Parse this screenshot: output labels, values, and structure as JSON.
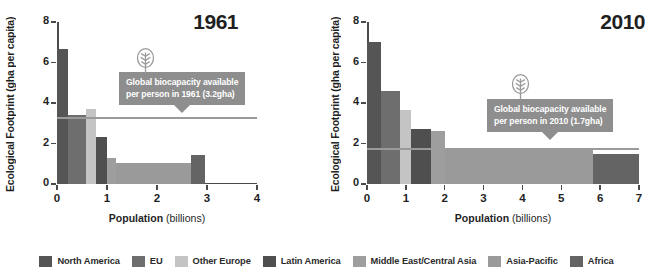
{
  "chart_data": [
    {
      "type": "bar",
      "title": "1961",
      "xlabel": "Population (billions)",
      "ylabel": "Ecological Footprint (gha per capita)",
      "xlim": [
        0,
        4
      ],
      "ylim": [
        0,
        8
      ],
      "xticks": [
        "0",
        "1",
        "2",
        "3",
        "4"
      ],
      "yticks": [
        "0",
        "2",
        "4",
        "6",
        "8"
      ],
      "grid": false,
      "legend_position": "bottom",
      "note": "Variable-width bars: width = population of region (billions), height = ecological footprint (gha per capita). Bars placed cumulatively left to right.",
      "bars": [
        {
          "name": "North America",
          "footprint": 6.65,
          "pop_start": 0.0,
          "pop_end": 0.22,
          "color": "#555555"
        },
        {
          "name": "EU",
          "footprint": 3.4,
          "pop_start": 0.22,
          "pop_end": 0.58,
          "color": "#6e6e6e"
        },
        {
          "name": "Other Europe",
          "footprint": 3.72,
          "pop_start": 0.58,
          "pop_end": 0.78,
          "color": "#c4c4c4"
        },
        {
          "name": "Latin America",
          "footprint": 2.32,
          "pop_start": 0.78,
          "pop_end": 1.0,
          "color": "#4f4f4f"
        },
        {
          "name": "Middle East/Central Asia",
          "footprint": 1.3,
          "pop_start": 1.0,
          "pop_end": 1.18,
          "color": "#9e9e9e"
        },
        {
          "name": "Asia-Pacific",
          "footprint": 1.05,
          "pop_start": 1.18,
          "pop_end": 2.68,
          "color": "#9a9a9a"
        },
        {
          "name": "Africa",
          "footprint": 1.45,
          "pop_start": 2.68,
          "pop_end": 2.95,
          "color": "#646464"
        }
      ],
      "reference_line": {
        "value": 3.2,
        "label": "Global biocapacity available per person in 1961 (3.2gha)",
        "color": "#9a9a9a"
      }
    },
    {
      "type": "bar",
      "title": "2010",
      "xlabel": "Population (billions)",
      "ylabel": "Ecological Footprint (gha per capita)",
      "xlim": [
        0,
        7
      ],
      "ylim": [
        0,
        8
      ],
      "xticks": [
        "0",
        "1",
        "2",
        "3",
        "4",
        "5",
        "6",
        "7"
      ],
      "yticks": [
        "0",
        "2",
        "4",
        "6",
        "8"
      ],
      "grid": false,
      "legend_position": "bottom",
      "note": "Variable-width bars: width = population of region (billions), height = ecological footprint (gha per capita). Bars placed cumulatively left to right.",
      "bars": [
        {
          "name": "North America",
          "footprint": 7.0,
          "pop_start": 0.0,
          "pop_end": 0.35,
          "color": "#555555"
        },
        {
          "name": "EU",
          "footprint": 4.6,
          "pop_start": 0.35,
          "pop_end": 0.85,
          "color": "#6e6e6e"
        },
        {
          "name": "Other Europe",
          "footprint": 3.65,
          "pop_start": 0.85,
          "pop_end": 1.13,
          "color": "#c4c4c4"
        },
        {
          "name": "Latin America",
          "footprint": 2.7,
          "pop_start": 1.13,
          "pop_end": 1.65,
          "color": "#4f4f4f"
        },
        {
          "name": "Middle East/Central Asia",
          "footprint": 2.6,
          "pop_start": 1.65,
          "pop_end": 2.0,
          "color": "#9e9e9e"
        },
        {
          "name": "Asia-Pacific",
          "footprint": 1.8,
          "pop_start": 2.0,
          "pop_end": 5.82,
          "color": "#9a9a9a"
        },
        {
          "name": "Africa",
          "footprint": 1.5,
          "pop_start": 5.82,
          "pop_end": 7.0,
          "color": "#646464"
        }
      ],
      "reference_line": {
        "value": 1.7,
        "label": "Global biocapacity available per person in 2010 (1.7gha)",
        "color": "#9a9a9a"
      }
    }
  ],
  "panels": {
    "left": {
      "title": "1961",
      "ylabel_main": "Ecological Footprint ",
      "ylabel_unit": "(gha per capita)",
      "xlabel_main": "Population ",
      "xlabel_unit": "(billions)",
      "callout_line1": "Global biocapacity available",
      "callout_line2": "per person in 1961 (3.2gha)"
    },
    "right": {
      "title": "2010",
      "ylabel_main": "Ecological Footprint ",
      "ylabel_unit": "(gha per capita)",
      "xlabel_main": "Population ",
      "xlabel_unit": "(billions)",
      "callout_line1": "Global biocapacity available",
      "callout_line2": "per person in 2010 (1.7gha)"
    }
  },
  "legend": {
    "items": [
      {
        "label": "North America",
        "color": "#555555"
      },
      {
        "label": "EU",
        "color": "#6e6e6e"
      },
      {
        "label": "Other Europe",
        "color": "#c4c4c4"
      },
      {
        "label": "Latin America",
        "color": "#4f4f4f"
      },
      {
        "label": "Middle East/Central Asia",
        "color": "#9e9e9e"
      },
      {
        "label": "Asia-Pacific",
        "color": "#9a9a9a"
      },
      {
        "label": "Africa",
        "color": "#646464"
      }
    ]
  }
}
